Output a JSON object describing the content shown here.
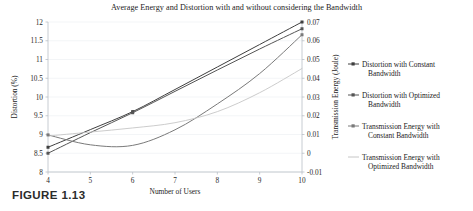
{
  "figure": {
    "caption": "FIGURE 1.13"
  },
  "chart_data": {
    "type": "line",
    "title": "Average Energy and Distortion with and without considering the Bandwidth",
    "xlabel": "Number of Users",
    "ylabel": "Distortion (%)",
    "y2label": "Transmission Energy (Joule)",
    "xlim": [
      4,
      10
    ],
    "ylim": [
      8,
      12
    ],
    "y2lim": [
      -0.01,
      0.07
    ],
    "xticks": [
      4,
      5,
      6,
      7,
      8,
      9,
      10
    ],
    "xticklabels": [
      "4",
      "5",
      "6",
      "7",
      "8",
      "9",
      "10"
    ],
    "yticks": [
      8,
      8.5,
      9,
      9.5,
      10,
      10.5,
      11,
      11.5,
      12
    ],
    "yticklabels": [
      "8",
      "8.5",
      "9",
      "9.5",
      "10",
      "10.5",
      "11",
      "11.5",
      "12"
    ],
    "y2ticks": [
      -0.01,
      0,
      0.01,
      0.02,
      0.03,
      0.04,
      0.05,
      0.06,
      0.07
    ],
    "y2ticklabels": [
      "-0.01",
      "0",
      "0.01",
      "0.02",
      "0.03",
      "0.04",
      "0.05",
      "0.06",
      "0.07"
    ],
    "grid": true,
    "legend_position": "right-outside",
    "x": [
      4,
      5,
      6,
      7,
      8,
      9,
      10
    ],
    "series": [
      {
        "name": "Distortion with Constant Bandwidth",
        "axis": "left",
        "color": "#3f3f3f",
        "marker": "square",
        "markers_at": [
          4,
          6,
          10
        ],
        "values": [
          8.66,
          9.13,
          9.61,
          10.2,
          10.8,
          11.4,
          12.0
        ]
      },
      {
        "name": "Distortion with Optimized Bandwidth",
        "axis": "left",
        "color": "#555555",
        "marker": "square",
        "markers_at": [
          4,
          6,
          10
        ],
        "values": [
          8.5,
          9.05,
          9.58,
          10.15,
          10.72,
          11.28,
          11.82
        ]
      },
      {
        "name": "Transmission Energy with Constant Bandwidth",
        "axis": "right",
        "color": "#7a7a7a",
        "marker": "square",
        "markers_at": [
          4,
          10
        ],
        "values": [
          0.0098,
          0.0045,
          0.0042,
          0.0125,
          0.0263,
          0.0425,
          0.0632
        ]
      },
      {
        "name": "Transmission Energy with Optimized Bandwidth",
        "axis": "right",
        "color": "#c6c6c6",
        "marker": "none",
        "markers_at": [],
        "values": [
          0.0092,
          0.0113,
          0.0135,
          0.0163,
          0.0222,
          0.0323,
          0.0452
        ]
      }
    ],
    "legend": [
      {
        "label_line1": "Distortion with Constant",
        "label_line2": "Bandwidth",
        "color": "#3f3f3f",
        "marker": "square"
      },
      {
        "label_line1": "Distortion with Optimized",
        "label_line2": "Bandwidth",
        "color": "#555555",
        "marker": "square"
      },
      {
        "label_line1": "Transmission Energy with",
        "label_line2": "Constant Bandwidth",
        "color": "#7a7a7a",
        "marker": "square"
      },
      {
        "label_line1": "Transmission Energy with",
        "label_line2": "Optimized Bandwidth",
        "color": "#c6c6c6",
        "marker": "none"
      }
    ]
  }
}
